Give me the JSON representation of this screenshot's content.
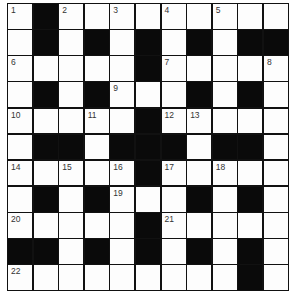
{
  "puzzle": {
    "rows": 11,
    "cols": 11,
    "block_color": "#0a0a0a",
    "cell_color": "#fdfdfd",
    "layout": [
      "W.WWWWWWWWW",
      "W.W.W.W.W..",
      "WWWWW.WWWWW",
      "W.W.WWW.W.W",
      "WWWWW.WWWWW",
      "W..W...W..W",
      "WWWWW.WWWWW",
      "W.W.WWW.W.W",
      "WWWWW.WWWWW",
      "..W.W.W.W.W",
      "WWWWWWWWW.W"
    ],
    "numbers": [
      {
        "r": 0,
        "c": 0,
        "n": "1"
      },
      {
        "r": 0,
        "c": 2,
        "n": "2"
      },
      {
        "r": 0,
        "c": 4,
        "n": "3"
      },
      {
        "r": 0,
        "c": 6,
        "n": "4"
      },
      {
        "r": 0,
        "c": 8,
        "n": "5"
      },
      {
        "r": 2,
        "c": 0,
        "n": "6"
      },
      {
        "r": 2,
        "c": 6,
        "n": "7"
      },
      {
        "r": 2,
        "c": 10,
        "n": "8"
      },
      {
        "r": 3,
        "c": 4,
        "n": "9"
      },
      {
        "r": 4,
        "c": 0,
        "n": "10"
      },
      {
        "r": 4,
        "c": 3,
        "n": "11"
      },
      {
        "r": 4,
        "c": 6,
        "n": "12"
      },
      {
        "r": 4,
        "c": 7,
        "n": "13"
      },
      {
        "r": 6,
        "c": 0,
        "n": "14"
      },
      {
        "r": 6,
        "c": 2,
        "n": "15"
      },
      {
        "r": 6,
        "c": 4,
        "n": "16"
      },
      {
        "r": 6,
        "c": 6,
        "n": "17"
      },
      {
        "r": 6,
        "c": 8,
        "n": "18"
      },
      {
        "r": 7,
        "c": 4,
        "n": "19"
      },
      {
        "r": 8,
        "c": 0,
        "n": "20"
      },
      {
        "r": 8,
        "c": 6,
        "n": "21"
      },
      {
        "r": 10,
        "c": 0,
        "n": "22"
      }
    ]
  }
}
